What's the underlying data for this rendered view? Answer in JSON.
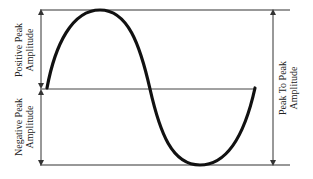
{
  "diagram": {
    "type": "sine-wave-amplitude",
    "colors": {
      "background": "#ffffff",
      "wave": "#111111",
      "lines": "#333333",
      "text": "#222222"
    },
    "labels": {
      "positive_peak": {
        "line1": "Positive Peak",
        "line2": "Amplitude"
      },
      "negative_peak": {
        "line1": "Negative Peak",
        "line2": "Amplitude"
      },
      "peak_to_peak": {
        "line1": "Peak To Peak",
        "line2": "Amplitude"
      }
    }
  }
}
